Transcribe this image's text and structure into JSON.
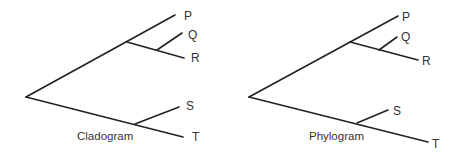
{
  "diagrams": [
    {
      "id": "cladogram",
      "caption": "Cladogram",
      "leaves": [
        "P",
        "Q",
        "R",
        "S",
        "T"
      ],
      "topology": "((P,(Q,R)),(S,T))",
      "branch_lengths": "uninformative (equal)"
    },
    {
      "id": "phylogram",
      "caption": "Phylogram",
      "leaves": [
        "P",
        "Q",
        "R",
        "S",
        "T"
      ],
      "topology": "((P,(Q,R)),(S,T))",
      "branch_lengths": "proportional to change"
    }
  ],
  "colors": {
    "line": "#222222",
    "text": "#333333",
    "background": "#ffffff"
  }
}
